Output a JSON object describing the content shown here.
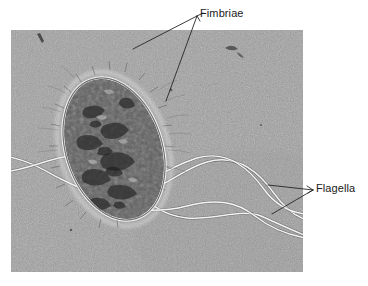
{
  "figure": {
    "type": "electron-micrograph",
    "background_color": "#ffffff",
    "micrograph": {
      "x": 11,
      "y": 30,
      "width": 292,
      "height": 242,
      "base_tone": "#9a9a9a",
      "grain": "fine speckled electron-micrograph noise",
      "cell": {
        "name": "bacterial-cell-body",
        "center_x": 103,
        "center_y": 149,
        "radius_x": 49,
        "radius_y": 74,
        "rotation_deg": -18,
        "interior_color": "#4a4a4a",
        "halo_color": "#f2f2f2",
        "description": "rod-shaped cell, dark granular cytoplasm, bright fimbrial halo"
      },
      "flagella_count": 4,
      "flagellum_color": "#f4f4f4"
    }
  },
  "labels": [
    {
      "id": "fimbriae",
      "text": "Fimbriae",
      "x": 200,
      "y": 8,
      "leader_lines": 2,
      "points_to": "bright filamentous fringe around cell"
    },
    {
      "id": "flagella",
      "text": "Flagella",
      "x": 316,
      "y": 183,
      "leader_lines": 2,
      "points_to": "long wavy filaments at right edge"
    }
  ],
  "colors": {
    "label_text": "#1a1a1a",
    "leader_line": "#2b2b2b",
    "page_background": "#ffffff"
  }
}
